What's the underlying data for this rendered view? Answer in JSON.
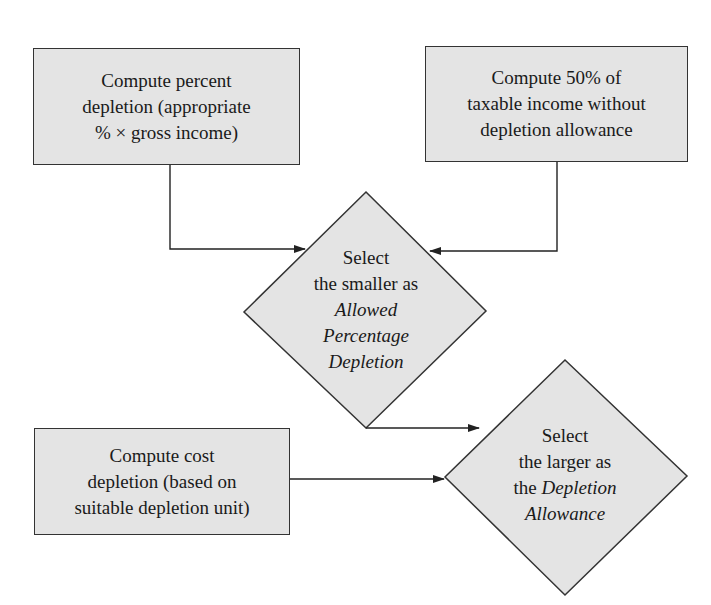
{
  "diagram": {
    "colors": {
      "node_fill": "#e4e4e4",
      "stroke": "#333333",
      "background": "#ffffff"
    },
    "nodes": {
      "percent_depletion": {
        "shape": "rectangle",
        "text": "Compute percent\ndepletion (appropriate\n% × gross income)"
      },
      "fifty_percent": {
        "shape": "rectangle",
        "text": "Compute 50% of\ntaxable income without\ndepletion allowance"
      },
      "select_smaller": {
        "shape": "diamond",
        "line1": "Select",
        "line2": "the smaller as",
        "line3": "Allowed",
        "line4": "Percentage",
        "line5": "Depletion"
      },
      "cost_depletion": {
        "shape": "rectangle",
        "text": "Compute cost\ndepletion (based on\nsuitable depletion unit)"
      },
      "select_larger": {
        "shape": "diamond",
        "line1": "Select",
        "line2": "the larger as",
        "line3_prefix": "the ",
        "line3_italic": "Depletion",
        "line4": "Allowance"
      }
    },
    "edges": [
      {
        "from": "percent_depletion",
        "to": "select_smaller"
      },
      {
        "from": "fifty_percent",
        "to": "select_smaller"
      },
      {
        "from": "select_smaller",
        "to": "select_larger"
      },
      {
        "from": "cost_depletion",
        "to": "select_larger"
      }
    ]
  }
}
